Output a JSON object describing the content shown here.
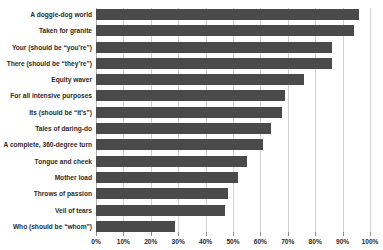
{
  "chart_data": {
    "type": "bar",
    "orientation": "horizontal",
    "title": "",
    "xlabel": "",
    "ylabel": "",
    "xlim": [
      0,
      100
    ],
    "xtick_labels": [
      "0%",
      "10%",
      "20%",
      "30%",
      "40%",
      "50%",
      "60%",
      "70%",
      "80%",
      "90%",
      "100%"
    ],
    "xtick_values": [
      0,
      10,
      20,
      30,
      40,
      50,
      60,
      70,
      80,
      90,
      100
    ],
    "grid": true,
    "legend": null,
    "bar_color": "#4a4a4a",
    "grid_color": "#d2d2d2",
    "categories": [
      "A doggie-dog world",
      "Taken for granite",
      "Your (should be “you’re”)",
      "There (should be “they’re”)",
      "Equity waver",
      "For all intensive purposes",
      "Its (should be “it’s”)",
      "Tales of daring-do",
      "A complete, 360-degree turn",
      "Tongue and cheek",
      "Mother load",
      "Throws of passion",
      "Veil of tears",
      "Who (should be “whom”)"
    ],
    "values": [
      96,
      94,
      86,
      86,
      76,
      69,
      68,
      64,
      61,
      55,
      52,
      48,
      47,
      29
    ]
  }
}
